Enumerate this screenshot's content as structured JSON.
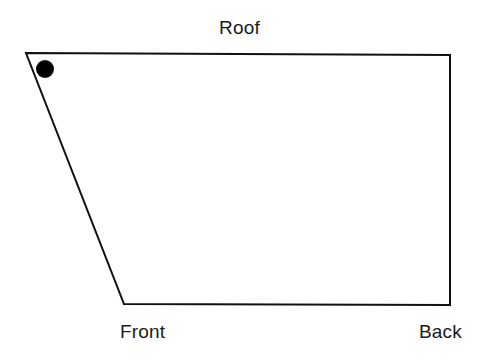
{
  "figure": {
    "title_text": "",
    "background_color": "#ffffff",
    "stroke_color": "#111111",
    "fill_color": "#ffffff",
    "marker_color": "#000000",
    "stroke_width": 2,
    "shape_type": "quadrilateral",
    "shape_points": "26,53 450,55 450,305 124,304",
    "vertices": [
      {
        "name": "top-left",
        "x": 26,
        "y": 53
      },
      {
        "name": "top-right",
        "x": 450,
        "y": 55
      },
      {
        "name": "bottom-right",
        "x": 450,
        "y": 305
      },
      {
        "name": "bottom-left",
        "x": 124,
        "y": 304
      }
    ],
    "marker": {
      "name": "reference-dot",
      "cx": 45,
      "cy": 69,
      "r": 9
    }
  },
  "labels": {
    "roof": "Roof",
    "front": "Front",
    "back": "Back"
  }
}
